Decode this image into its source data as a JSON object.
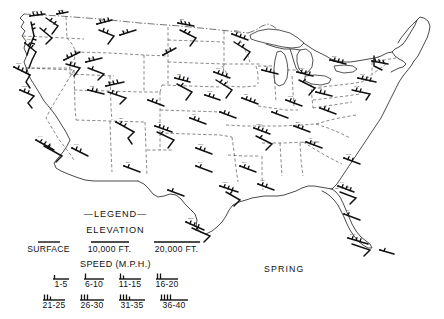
{
  "map": {
    "title_label": "SPRING",
    "region": "continental-united-states",
    "projection_note": "",
    "line_color": "#2b2b2b",
    "background_color": "#ffffff"
  },
  "legend": {
    "heading": "—LEGEND—",
    "elevation_heading": "ELEVATION",
    "elevation_levels": [
      {
        "label": "SURFACE",
        "bar_length": 18
      },
      {
        "label": "10,000 FT.",
        "bar_length": 30
      },
      {
        "label": "20,000 FT.",
        "bar_length": 42
      }
    ],
    "speed_heading": "SPEED (M.P.H.)",
    "speed_classes_row1": [
      {
        "label": "1-5",
        "barbs": 1,
        "half": true
      },
      {
        "label": "6-10",
        "barbs": 1,
        "half": false
      },
      {
        "label": "11-15",
        "barbs": 2,
        "half": true
      },
      {
        "label": "16-20",
        "barbs": 2,
        "half": false
      }
    ],
    "speed_classes_row2": [
      {
        "label": "21-25",
        "barbs": 3,
        "half": true
      },
      {
        "label": "26-30",
        "barbs": 3,
        "half": false
      },
      {
        "label": "31-35",
        "barbs": 4,
        "half": true
      },
      {
        "label": "36-40",
        "barbs": 4,
        "half": false
      }
    ]
  },
  "stations": [
    {
      "name": "SEATTLE",
      "x": 30,
      "y": 16
    },
    {
      "name": "SPOKANE",
      "x": 57,
      "y": 14
    },
    {
      "name": "PORTLAND",
      "x": 25,
      "y": 43
    },
    {
      "name": "BOISE",
      "x": 64,
      "y": 60
    },
    {
      "name": "MEDFORD",
      "x": 14,
      "y": 67
    },
    {
      "name": "RENO",
      "x": 37,
      "y": 95
    },
    {
      "name": "SALT LAKE",
      "x": 92,
      "y": 92
    },
    {
      "name": "ELY",
      "x": 104,
      "y": 86
    },
    {
      "name": "BILLINGS",
      "x": 120,
      "y": 35
    },
    {
      "name": "GT. FALLS",
      "x": 97,
      "y": 24
    },
    {
      "name": "BISMARCK",
      "x": 178,
      "y": 23
    },
    {
      "name": "ST. PAUL",
      "x": 232,
      "y": 34
    },
    {
      "name": "DULUTH",
      "x": 238,
      "y": 21
    },
    {
      "name": "RAPID CITY",
      "x": 163,
      "y": 55
    },
    {
      "name": "N. PLATTE",
      "x": 175,
      "y": 78
    },
    {
      "name": "OMAHA",
      "x": 214,
      "y": 72
    },
    {
      "name": "CHICAGO",
      "x": 262,
      "y": 70
    },
    {
      "name": "DETROIT",
      "x": 297,
      "y": 72
    },
    {
      "name": "CLEVELAND",
      "x": 312,
      "y": 80
    },
    {
      "name": "BUFFALO",
      "x": 330,
      "y": 60
    },
    {
      "name": "ALBANY",
      "x": 372,
      "y": 61
    },
    {
      "name": "BOSTON",
      "x": 400,
      "y": 56
    },
    {
      "name": "NEW YORK",
      "x": 385,
      "y": 73
    },
    {
      "name": "WASHINGTON",
      "x": 360,
      "y": 92
    },
    {
      "name": "PITTSBURGH",
      "x": 322,
      "y": 92
    },
    {
      "name": "CINCINNATI",
      "x": 290,
      "y": 100
    },
    {
      "name": "ST. LOUIS",
      "x": 242,
      "y": 98
    },
    {
      "name": "KANSAS CITY",
      "x": 205,
      "y": 95
    },
    {
      "name": "DENVER",
      "x": 134,
      "y": 93
    },
    {
      "name": "GRAND JCT",
      "x": 112,
      "y": 103
    },
    {
      "name": "ALBUQUERQUE",
      "x": 122,
      "y": 140
    },
    {
      "name": "PHOENIX",
      "x": 74,
      "y": 150
    },
    {
      "name": "LOS ANGELES",
      "x": 42,
      "y": 148
    },
    {
      "name": "SAN DIEGO",
      "x": 50,
      "y": 160
    },
    {
      "name": "EL PASO",
      "x": 130,
      "y": 168
    },
    {
      "name": "AMARILLO",
      "x": 160,
      "y": 152
    },
    {
      "name": "OKLA. CITY",
      "x": 196,
      "y": 155
    },
    {
      "name": "WICHITA",
      "x": 196,
      "y": 128
    },
    {
      "name": "LITTLE ROCK",
      "x": 240,
      "y": 150
    },
    {
      "name": "MEMPHIS",
      "x": 256,
      "y": 140
    },
    {
      "name": "NASHVILLE",
      "x": 285,
      "y": 130
    },
    {
      "name": "ATLANTA",
      "x": 305,
      "y": 148
    },
    {
      "name": "BIRMINGHAM",
      "x": 288,
      "y": 150
    },
    {
      "name": "DALLAS",
      "x": 200,
      "y": 172
    },
    {
      "name": "SAN ANTONIO",
      "x": 188,
      "y": 200
    },
    {
      "name": "HOUSTON",
      "x": 222,
      "y": 195
    },
    {
      "name": "NEW ORLEANS",
      "x": 262,
      "y": 190
    },
    {
      "name": "SHREVEPORT",
      "x": 240,
      "y": 172
    },
    {
      "name": "CHARLESTON",
      "x": 352,
      "y": 162
    },
    {
      "name": "JACKSONVILLE",
      "x": 348,
      "y": 186
    },
    {
      "name": "TAMPA",
      "x": 352,
      "y": 215
    },
    {
      "name": "MIAMI",
      "x": 370,
      "y": 237
    },
    {
      "name": "KEY WEST",
      "x": 355,
      "y": 245
    },
    {
      "name": "BROWNSVILLE",
      "x": 195,
      "y": 228
    }
  ]
}
